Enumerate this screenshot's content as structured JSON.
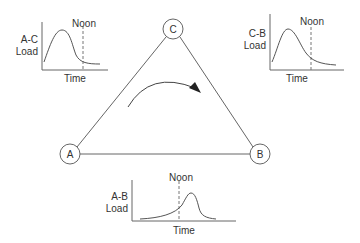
{
  "nodes": {
    "A": {
      "label": "A"
    },
    "B": {
      "label": "B"
    },
    "C": {
      "label": "C"
    }
  },
  "charts": {
    "ac": {
      "line1": "A-C",
      "line2": "Load",
      "xlabel": "Time",
      "marker": "Noon"
    },
    "cb": {
      "line1": "C-B",
      "line2": "Load",
      "xlabel": "Time",
      "marker": "Noon"
    },
    "ab": {
      "line1": "A-B",
      "line2": "Load",
      "xlabel": "Time",
      "marker": "Noon"
    }
  },
  "colors": {
    "line": "#555555",
    "text": "#333333"
  }
}
